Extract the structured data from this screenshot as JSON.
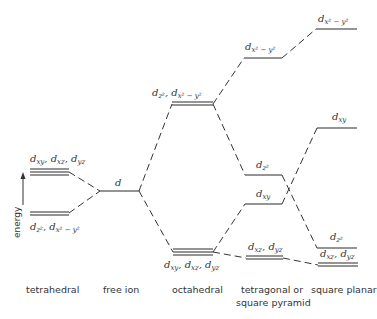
{
  "diagram": {
    "type": "crystal-field-splitting",
    "axis_label": "energy",
    "columns": [
      {
        "id": "tetrahedral",
        "label": "tetrahedral",
        "levels": [
          {
            "orbitals": "dxy, dxz, dyz",
            "position": "upper",
            "degeneracy": 3
          },
          {
            "orbitals": "dz2, dx2-y2",
            "position": "lower",
            "degeneracy": 2
          }
        ]
      },
      {
        "id": "free-ion",
        "label": "free ion",
        "levels": [
          {
            "orbitals": "d",
            "degeneracy": 1
          }
        ]
      },
      {
        "id": "octahedral",
        "label": "octahedral",
        "levels": [
          {
            "orbitals": "dz2, dx2-y2",
            "position": "upper",
            "degeneracy": 2
          },
          {
            "orbitals": "dxy, dxz, dyz",
            "position": "lower",
            "degeneracy": 3
          }
        ]
      },
      {
        "id": "tetragonal",
        "label_line1": "tetragonal or",
        "label_line2": "square pyramid",
        "levels": [
          {
            "orbitals": "dx2-y2",
            "degeneracy": 1
          },
          {
            "orbitals": "dz2",
            "degeneracy": 1
          },
          {
            "orbitals": "dxy",
            "degeneracy": 1
          },
          {
            "orbitals": "dxz, dyz",
            "degeneracy": 2
          }
        ]
      },
      {
        "id": "square-planar",
        "label": "square planar",
        "levels": [
          {
            "orbitals": "dx2-y2",
            "degeneracy": 1
          },
          {
            "orbitals": "dxy",
            "degeneracy": 1
          },
          {
            "orbitals": "dz2",
            "degeneracy": 1
          },
          {
            "orbitals": "dxz, dyz",
            "degeneracy": 2
          }
        ]
      }
    ]
  }
}
